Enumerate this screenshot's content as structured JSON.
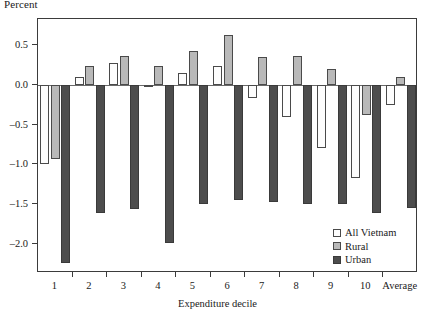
{
  "chart_data": {
    "type": "bar",
    "title": "",
    "ylabel": "Percent",
    "xlabel": "Expenditure decile",
    "categories": [
      "1",
      "2",
      "3",
      "4",
      "5",
      "6",
      "7",
      "8",
      "9",
      "10",
      "Average"
    ],
    "series": [
      {
        "name": "All Vietnam",
        "color": "#fdfdfd",
        "values": [
          -1.0,
          0.1,
          0.27,
          -0.02,
          0.15,
          0.24,
          -0.17,
          -0.4,
          -0.8,
          -1.17,
          -0.25
        ]
      },
      {
        "name": "Rural",
        "color": "#b9b9b9",
        "values": [
          -0.93,
          0.24,
          0.37,
          0.24,
          0.43,
          0.63,
          0.35,
          0.36,
          0.2,
          -0.38,
          0.1
        ]
      },
      {
        "name": "Urban",
        "color": "#4d4d4d",
        "values": [
          -2.25,
          -1.62,
          -1.57,
          -1.99,
          -1.5,
          -1.45,
          -1.48,
          -1.5,
          -1.5,
          -1.62,
          -1.55
        ]
      }
    ],
    "ylim": [
      -2.37,
      0.83
    ],
    "ytick_values": [
      0.5,
      0.0,
      -0.5,
      -1.0,
      -1.5,
      -2.0
    ],
    "ytick_labels": [
      "0.5",
      "0.0",
      "–0.5",
      "–1.0",
      "–1.5",
      "–2.0"
    ],
    "grid": false,
    "legend_position": "bottom-right",
    "legend_entries": [
      "All Vietnam",
      "Rural",
      "Urban"
    ]
  }
}
